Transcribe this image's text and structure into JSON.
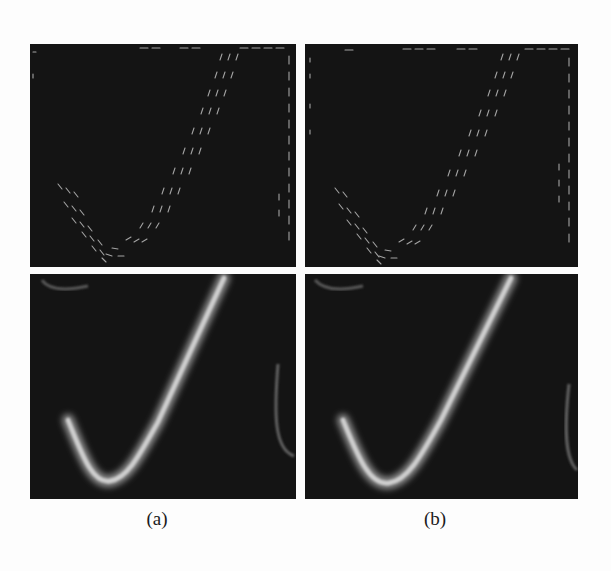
{
  "figure": {
    "panels": [
      {
        "id": "a",
        "caption": "(a)",
        "top": "vector-field",
        "bottom": "stroke-rendering"
      },
      {
        "id": "b",
        "caption": "(b)",
        "top": "vector-field",
        "bottom": "stroke-rendering"
      }
    ],
    "colors": {
      "panel_background": "#141414",
      "stroke": "#c8c8c8",
      "vectors": "#bdbdbd",
      "page_background": "#fdfdfd"
    }
  }
}
